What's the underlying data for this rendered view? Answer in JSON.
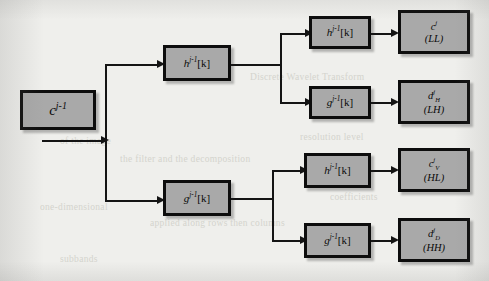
{
  "diagram": {
    "background_color": "#efefec",
    "box_fill_color": "#a9a9a9",
    "box_border_color": "#0d0d0d",
    "line_color": "#141414",
    "input": {
      "id": "input-approximation",
      "base": "c",
      "superscript": "j-1",
      "label": "c^{j-1}"
    },
    "stage1": [
      {
        "id": "stage1-lowpass",
        "base": "h",
        "superscript": "j-1",
        "index": "[k]",
        "label": "h^{j-1}[k]"
      },
      {
        "id": "stage1-highpass",
        "base": "g",
        "superscript": "j-1",
        "index": "[k]",
        "label": "g^{j-1}[k]"
      }
    ],
    "stage2": [
      {
        "id": "stage2-lowpass-ll",
        "base": "h",
        "superscript": "j-1",
        "index": "[k]",
        "label": "h^{j-1}[k]"
      },
      {
        "id": "stage2-highpass-lh",
        "base": "g",
        "superscript": "j-1",
        "index": "[k]",
        "label": "g^{j-1}[k]"
      },
      {
        "id": "stage2-lowpass-hl",
        "base": "h",
        "superscript": "j-1",
        "index": "[k]",
        "label": "h^{j-1}[k]"
      },
      {
        "id": "stage2-highpass-hh",
        "base": "g",
        "superscript": "j-1",
        "index": "[k]",
        "label": "g^{j-1}[k]"
      }
    ],
    "outputs": [
      {
        "id": "output-ll",
        "base": "c",
        "superscript": "j",
        "subscript": "",
        "subband": "(LL)",
        "label": "c^{j} (LL)"
      },
      {
        "id": "output-lh",
        "base": "d",
        "superscript": "j",
        "subscript": "H",
        "subband": "(LH)",
        "label": "d^{j}_{H} (LH)"
      },
      {
        "id": "output-hl",
        "base": "c",
        "superscript": "j",
        "subscript": "V",
        "subband": "(HL)",
        "label": "c^{j}_{V} (HL)"
      },
      {
        "id": "output-hh",
        "base": "d",
        "superscript": "j",
        "subscript": "D",
        "subband": "(HH)",
        "label": "d^{j}_{D} (HH)"
      }
    ],
    "ghost_text": [
      {
        "text": "Discrete Wavelet Transform",
        "x": 250,
        "y": 78
      },
      {
        "text": "of the image",
        "x": 60,
        "y": 140
      },
      {
        "text": "the filter and the decomposition",
        "x": 120,
        "y": 158
      },
      {
        "text": "resolution level",
        "x": 300,
        "y": 136
      },
      {
        "text": "coefficients",
        "x": 330,
        "y": 196
      },
      {
        "text": "one-dimensional",
        "x": 40,
        "y": 206
      },
      {
        "text": "applied along rows then columns",
        "x": 150,
        "y": 222
      },
      {
        "text": "subbands",
        "x": 60,
        "y": 258
      }
    ]
  }
}
